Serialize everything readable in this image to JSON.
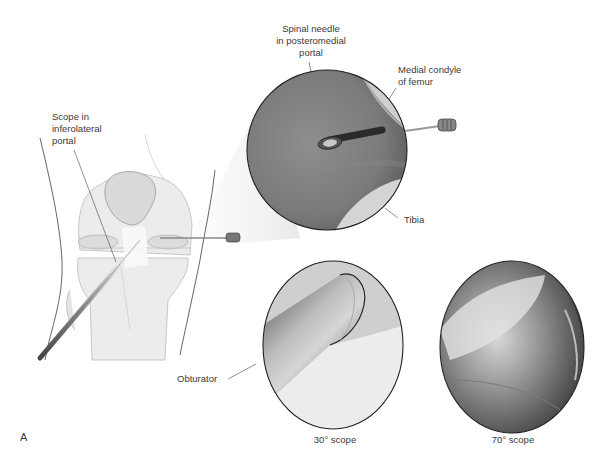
{
  "figure": {
    "panel_label": "A",
    "labels": {
      "scope_portal": [
        "Scope in",
        "inferolateral",
        "portal"
      ],
      "spinal_needle": [
        "Spinal needle",
        "in posteromedial",
        "portal"
      ],
      "medial_condyle": [
        "Medial condyle",
        "of femur"
      ],
      "tibia": "Tibia",
      "obturator": "Obturator"
    },
    "captions": {
      "scope_30": "30° scope",
      "scope_70": "70° scope"
    },
    "views": [
      {
        "id": "posteromedial-view",
        "description": "Arthroscopic view of spinal needle in posteromedial compartment"
      },
      {
        "id": "30-degree-view",
        "description": "Arthroscopic view through 30° scope showing obturator"
      },
      {
        "id": "70-degree-view",
        "description": "Arthroscopic view through 70° scope"
      }
    ]
  }
}
